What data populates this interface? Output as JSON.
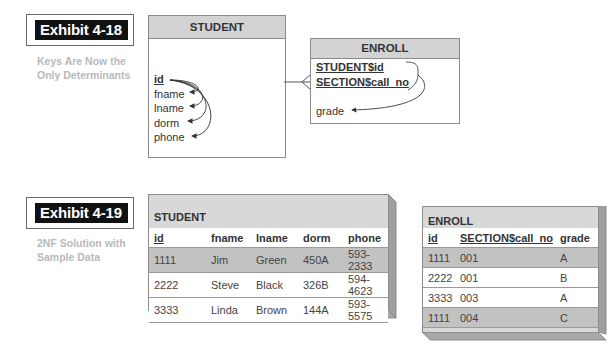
{
  "exhibit_18": {
    "label": "Exhibit 4-18",
    "caption_line1": "Keys Are Now the",
    "caption_line2": "Only Determinants",
    "student_entity": {
      "title": "STUDENT",
      "attributes": [
        "id",
        "fname",
        "lname",
        "dorm",
        "phone"
      ],
      "primary_key": "id"
    },
    "enroll_entity": {
      "title": "ENROLL",
      "key_attributes": [
        "STUDENT$id",
        "SECTION$call_no"
      ],
      "attributes": [
        "grade"
      ]
    },
    "relationship": "one-to-many (STUDENT to ENROLL)"
  },
  "exhibit_19": {
    "label": "Exhibit 4-19",
    "caption_line1": "2NF Solution with",
    "caption_line2": "Sample Data",
    "student_table": {
      "title": "STUDENT",
      "columns": [
        "id",
        "fname",
        "lname",
        "dorm",
        "phone"
      ],
      "rows": [
        [
          "1111",
          "Jim",
          "Green",
          "450A",
          "593-2333"
        ],
        [
          "2222",
          "Steve",
          "Black",
          "326B",
          "594-4623"
        ],
        [
          "3333",
          "Linda",
          "Brown",
          "144A",
          "593-5575"
        ]
      ]
    },
    "enroll_table": {
      "title": "ENROLL",
      "columns": [
        "id",
        "SECTION$call_no",
        "grade"
      ],
      "rows": [
        [
          "1111",
          "001",
          "A"
        ],
        [
          "2222",
          "001",
          "B"
        ],
        [
          "3333",
          "003",
          "A"
        ],
        [
          "1111",
          "004",
          "C"
        ]
      ]
    }
  }
}
